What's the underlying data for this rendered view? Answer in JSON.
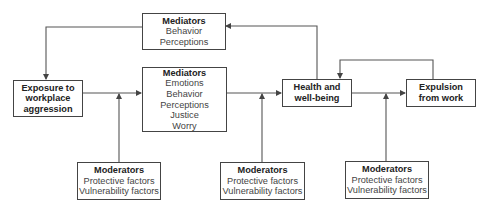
{
  "diagram": {
    "type": "flow-model",
    "nodes": {
      "exposure": {
        "title_lines": [
          "Exposure to",
          "workplace",
          "aggression"
        ]
      },
      "mediators_top": {
        "title": "Mediators",
        "items": [
          "Behavior",
          "Perceptions"
        ]
      },
      "mediators_mid": {
        "title": "Mediators",
        "items": [
          "Emotions",
          "Behavior",
          "Perceptions",
          "Justice",
          "Worry"
        ]
      },
      "health": {
        "title_lines": [
          "Health and",
          "well-being"
        ]
      },
      "expulsion": {
        "title_lines": [
          "Expulsion",
          "from work"
        ]
      },
      "moderators_1": {
        "title": "Moderators",
        "items": [
          "Protective factors",
          "Vulnerability factors"
        ]
      },
      "moderators_2": {
        "title": "Moderators",
        "items": [
          "Protective factors",
          "Vulnerability factors"
        ]
      },
      "moderators_3": {
        "title": "Moderators",
        "items": [
          "Protective factors",
          "Vulnerability factors"
        ]
      }
    },
    "edges": [
      {
        "from": "exposure",
        "to": "health",
        "via": "mediators_mid"
      },
      {
        "from": "health",
        "to": "mediators_top"
      },
      {
        "from": "mediators_top",
        "to": "exposure"
      },
      {
        "from": "health",
        "to": "expulsion"
      },
      {
        "from": "expulsion",
        "to": "health"
      },
      {
        "from": "moderators_1",
        "to": "exposure->mediators_mid"
      },
      {
        "from": "moderators_2",
        "to": "mediators_mid->health"
      },
      {
        "from": "moderators_3",
        "to": "health->expulsion"
      }
    ],
    "colors": {
      "line": "#444444",
      "text": "#333333",
      "background": "#ffffff"
    }
  }
}
